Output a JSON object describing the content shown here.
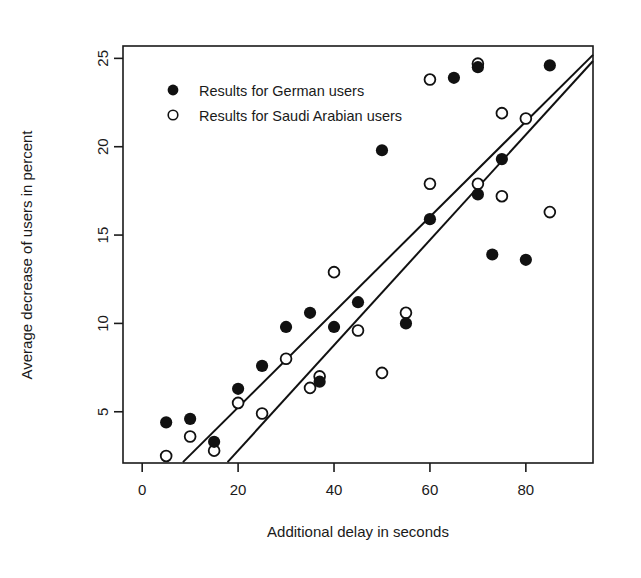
{
  "chart_data": {
    "type": "scatter",
    "title": "",
    "xlabel": "Additional delay in seconds",
    "ylabel": "Average decrease of users in percent",
    "xlim": [
      -4,
      94
    ],
    "ylim": [
      2.1,
      25.7
    ],
    "xticks": [
      0,
      20,
      40,
      60,
      80
    ],
    "xtick_labels": [
      "0",
      "20",
      "40",
      "60",
      "80"
    ],
    "yticks": [
      5,
      10,
      15,
      20,
      25
    ],
    "ytick_labels": [
      "5",
      "10",
      "15",
      "20",
      "25"
    ],
    "grid": false,
    "legend_position": "top-left",
    "series": [
      {
        "name": "Results for German users",
        "marker": "filled-circle",
        "color": "#111111",
        "points": [
          {
            "x": 5,
            "y": 4.4
          },
          {
            "x": 10,
            "y": 4.6
          },
          {
            "x": 15,
            "y": 3.3
          },
          {
            "x": 20,
            "y": 6.3
          },
          {
            "x": 25,
            "y": 7.6
          },
          {
            "x": 30,
            "y": 9.8
          },
          {
            "x": 35,
            "y": 10.6
          },
          {
            "x": 37,
            "y": 6.7
          },
          {
            "x": 40,
            "y": 9.8
          },
          {
            "x": 45,
            "y": 11.2
          },
          {
            "x": 50,
            "y": 19.8
          },
          {
            "x": 55,
            "y": 10.0
          },
          {
            "x": 60,
            "y": 15.9
          },
          {
            "x": 65,
            "y": 23.9
          },
          {
            "x": 70,
            "y": 24.5
          },
          {
            "x": 70,
            "y": 17.3
          },
          {
            "x": 73,
            "y": 13.9
          },
          {
            "x": 75,
            "y": 19.3
          },
          {
            "x": 80,
            "y": 13.6
          },
          {
            "x": 85,
            "y": 24.6
          }
        ]
      },
      {
        "name": "Results for Saudi Arabian users",
        "marker": "open-circle",
        "color": "#111111",
        "points": [
          {
            "x": 5,
            "y": 2.5
          },
          {
            "x": 10,
            "y": 3.6
          },
          {
            "x": 15,
            "y": 2.8
          },
          {
            "x": 20,
            "y": 5.5
          },
          {
            "x": 25,
            "y": 4.9
          },
          {
            "x": 30,
            "y": 8.0
          },
          {
            "x": 35,
            "y": 6.35
          },
          {
            "x": 37,
            "y": 7.0
          },
          {
            "x": 40,
            "y": 12.9
          },
          {
            "x": 45,
            "y": 9.6
          },
          {
            "x": 50,
            "y": 7.2
          },
          {
            "x": 55,
            "y": 10.6
          },
          {
            "x": 60,
            "y": 23.8
          },
          {
            "x": 60,
            "y": 17.9
          },
          {
            "x": 70,
            "y": 24.7
          },
          {
            "x": 70,
            "y": 17.9
          },
          {
            "x": 75,
            "y": 21.9
          },
          {
            "x": 75,
            "y": 17.2
          },
          {
            "x": 80,
            "y": 21.6
          },
          {
            "x": 85,
            "y": 16.3
          }
        ]
      }
    ],
    "trend_lines": [
      {
        "name": "German users fit",
        "x_start": 8.5,
        "y_start": 2.15,
        "x_end": 94,
        "y_end": 25.2,
        "color": "#111111",
        "width": 2
      },
      {
        "name": "Saudi Arabian users fit",
        "x_start": 17.8,
        "y_start": 2.15,
        "x_end": 94,
        "y_end": 24.85,
        "color": "#111111",
        "width": 2
      }
    ]
  },
  "legend": {
    "items": [
      {
        "label": "Results for German users",
        "marker": "filled-circle"
      },
      {
        "label": "Results for Saudi Arabian users",
        "marker": "open-circle"
      }
    ]
  },
  "axes": {
    "x_title": "Additional delay in seconds",
    "y_title": "Average decrease of users in percent"
  }
}
